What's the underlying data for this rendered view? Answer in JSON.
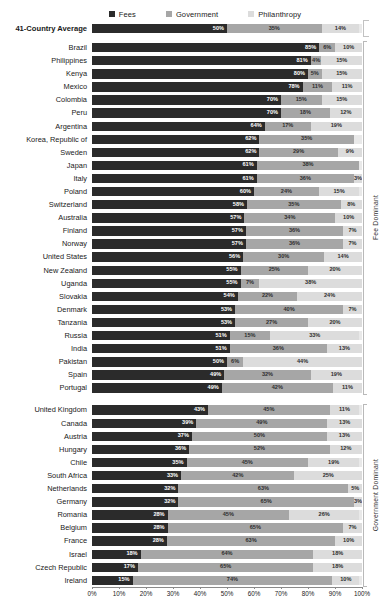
{
  "legend": {
    "items": [
      {
        "label": "Fees",
        "color": "#2b2b2b"
      },
      {
        "label": "Government",
        "color": "#a6a6a6"
      },
      {
        "label": "Philanthropy",
        "color": "#dcdcdc"
      }
    ]
  },
  "groups": {
    "fee_dominant": "Fee Dominant",
    "government_dominant": "Government Dominant"
  },
  "axis": {
    "xlabel": "Percentage of CSO Revenue",
    "ticks": [
      "0%",
      "10%",
      "20%",
      "30%",
      "40%",
      "50%",
      "60%",
      "70%",
      "80%",
      "90%",
      "100%"
    ]
  },
  "chart_data": {
    "type": "bar",
    "orientation": "horizontal",
    "stacked": true,
    "title": "",
    "xlabel": "Percentage of CSO Revenue",
    "ylabel": "",
    "xlim": [
      0,
      100
    ],
    "grid": false,
    "legend_position": "top-center",
    "series": [
      {
        "name": "Fees",
        "color": "#2b2b2b"
      },
      {
        "name": "Government",
        "color": "#a6a6a6"
      },
      {
        "name": "Philanthropy",
        "color": "#dcdcdc"
      }
    ],
    "categories": [
      "41-Country Average",
      "Brazil",
      "Philippines",
      "Kenya",
      "Mexico",
      "Colombia",
      "Peru",
      "Argentina",
      "Korea, Republic of",
      "Sweden",
      "Japan",
      "Italy",
      "Poland",
      "Switzerland",
      "Australia",
      "Finland",
      "Norway",
      "United States",
      "New Zealand",
      "Uganda",
      "Slovakia",
      "Denmark",
      "Tanzania",
      "Russia",
      "India",
      "Pakistan",
      "Spain",
      "Portugal",
      "United Kingdom",
      "Canada",
      "Austria",
      "Hungary",
      "Chile",
      "South Africa",
      "Netherlands",
      "Germany",
      "Romania",
      "Belgium",
      "France",
      "Israel",
      "Czech Republic",
      "Ireland"
    ],
    "values": {
      "Fees": [
        50,
        85,
        81,
        80,
        78,
        70,
        70,
        64,
        62,
        62,
        61,
        61,
        60,
        58,
        57,
        57,
        57,
        56,
        55,
        55,
        54,
        53,
        53,
        51,
        51,
        50,
        49,
        49,
        43,
        39,
        37,
        36,
        35,
        33,
        32,
        32,
        28,
        28,
        28,
        18,
        17,
        15
      ],
      "Government": [
        35,
        6,
        4,
        5,
        11,
        15,
        18,
        17,
        35,
        29,
        38,
        36,
        24,
        35,
        34,
        36,
        36,
        30,
        25,
        7,
        22,
        40,
        27,
        15,
        36,
        6,
        32,
        42,
        45,
        49,
        50,
        52,
        45,
        42,
        63,
        65,
        45,
        65,
        63,
        64,
        65,
        74
      ],
      "Philanthropy": [
        14,
        10,
        15,
        15,
        11,
        15,
        12,
        19,
        0,
        9,
        0,
        3,
        15,
        8,
        10,
        7,
        7,
        14,
        20,
        38,
        24,
        7,
        20,
        33,
        13,
        44,
        19,
        11,
        11,
        13,
        13,
        12,
        19,
        25,
        5,
        3,
        26,
        7,
        10,
        18,
        18,
        10
      ]
    }
  },
  "rows": [
    {
      "label": "41-Country Average",
      "fees": 50,
      "gov": 35,
      "phil": 14,
      "fees_txt": "50%",
      "gov_txt": "35%",
      "phil_txt": "14%",
      "group": "average"
    },
    {
      "label": "Brazil",
      "fees": 85,
      "gov": 6,
      "phil": 10,
      "fees_txt": "85%",
      "gov_txt": "6%",
      "phil_txt": "10%",
      "group": "fee"
    },
    {
      "label": "Philippines",
      "fees": 81,
      "gov": 4,
      "phil": 15,
      "fees_txt": "81%",
      "gov_txt": "4%",
      "phil_txt": "15%",
      "group": "fee"
    },
    {
      "label": "Kenya",
      "fees": 80,
      "gov": 5,
      "phil": 15,
      "fees_txt": "80%",
      "gov_txt": "5%",
      "phil_txt": "15%",
      "group": "fee"
    },
    {
      "label": "Mexico",
      "fees": 78,
      "gov": 11,
      "phil": 11,
      "fees_txt": "78%",
      "gov_txt": "11%",
      "phil_txt": "11%",
      "group": "fee"
    },
    {
      "label": "Colombia",
      "fees": 70,
      "gov": 15,
      "phil": 15,
      "fees_txt": "70%",
      "gov_txt": "15%",
      "phil_txt": "15%",
      "group": "fee"
    },
    {
      "label": "Peru",
      "fees": 70,
      "gov": 18,
      "phil": 12,
      "fees_txt": "70%",
      "gov_txt": "18%",
      "phil_txt": "12%",
      "group": "fee"
    },
    {
      "label": "Argentina",
      "fees": 64,
      "gov": 17,
      "phil": 19,
      "fees_txt": "64%",
      "gov_txt": "17%",
      "phil_txt": "19%",
      "group": "fee"
    },
    {
      "label": "Korea, Republic of",
      "fees": 62,
      "gov": 35,
      "phil": 0,
      "fees_txt": "62%",
      "gov_txt": "35%",
      "phil_txt": "",
      "group": "fee"
    },
    {
      "label": "Sweden",
      "fees": 62,
      "gov": 29,
      "phil": 9,
      "fees_txt": "62%",
      "gov_txt": "29%",
      "phil_txt": "9%",
      "group": "fee"
    },
    {
      "label": "Japan",
      "fees": 61,
      "gov": 38,
      "phil": 0,
      "fees_txt": "61%",
      "gov_txt": "38%",
      "phil_txt": "",
      "group": "fee"
    },
    {
      "label": "Italy",
      "fees": 61,
      "gov": 36,
      "phil": 3,
      "fees_txt": "61%",
      "gov_txt": "36%",
      "phil_txt": "3%",
      "group": "fee"
    },
    {
      "label": "Poland",
      "fees": 60,
      "gov": 24,
      "phil": 15,
      "fees_txt": "60%",
      "gov_txt": "24%",
      "phil_txt": "15%",
      "group": "fee"
    },
    {
      "label": "Switzerland",
      "fees": 58,
      "gov": 35,
      "phil": 8,
      "fees_txt": "58%",
      "gov_txt": "35%",
      "phil_txt": "8%",
      "group": "fee"
    },
    {
      "label": "Australia",
      "fees": 57,
      "gov": 34,
      "phil": 10,
      "fees_txt": "57%",
      "gov_txt": "34%",
      "phil_txt": "10%",
      "group": "fee"
    },
    {
      "label": "Finland",
      "fees": 57,
      "gov": 36,
      "phil": 7,
      "fees_txt": "57%",
      "gov_txt": "36%",
      "phil_txt": "7%",
      "group": "fee"
    },
    {
      "label": "Norway",
      "fees": 57,
      "gov": 36,
      "phil": 7,
      "fees_txt": "57%",
      "gov_txt": "36%",
      "phil_txt": "7%",
      "group": "fee"
    },
    {
      "label": "United States",
      "fees": 56,
      "gov": 30,
      "phil": 14,
      "fees_txt": "56%",
      "gov_txt": "30%",
      "phil_txt": "14%",
      "group": "fee"
    },
    {
      "label": "New Zealand",
      "fees": 55,
      "gov": 25,
      "phil": 20,
      "fees_txt": "55%",
      "gov_txt": "25%",
      "phil_txt": "20%",
      "group": "fee"
    },
    {
      "label": "Uganda",
      "fees": 55,
      "gov": 7,
      "phil": 38,
      "fees_txt": "55%",
      "gov_txt": "7%",
      "phil_txt": "38%",
      "group": "fee"
    },
    {
      "label": "Slovakia",
      "fees": 54,
      "gov": 22,
      "phil": 24,
      "fees_txt": "54%",
      "gov_txt": "22%",
      "phil_txt": "24%",
      "group": "fee"
    },
    {
      "label": "Denmark",
      "fees": 53,
      "gov": 40,
      "phil": 7,
      "fees_txt": "53%",
      "gov_txt": "40%",
      "phil_txt": "7%",
      "group": "fee"
    },
    {
      "label": "Tanzania",
      "fees": 53,
      "gov": 27,
      "phil": 20,
      "fees_txt": "53%",
      "gov_txt": "27%",
      "phil_txt": "20%",
      "group": "fee"
    },
    {
      "label": "Russia",
      "fees": 51,
      "gov": 15,
      "phil": 33,
      "fees_txt": "51%",
      "gov_txt": "15%",
      "phil_txt": "33%",
      "group": "fee"
    },
    {
      "label": "India",
      "fees": 51,
      "gov": 36,
      "phil": 13,
      "fees_txt": "51%",
      "gov_txt": "36%",
      "phil_txt": "13%",
      "group": "fee"
    },
    {
      "label": "Pakistan",
      "fees": 50,
      "gov": 6,
      "phil": 44,
      "fees_txt": "50%",
      "gov_txt": "6%",
      "phil_txt": "44%",
      "group": "fee"
    },
    {
      "label": "Spain",
      "fees": 49,
      "gov": 32,
      "phil": 19,
      "fees_txt": "49%",
      "gov_txt": "32%",
      "phil_txt": "19%",
      "group": "fee"
    },
    {
      "label": "Portugal",
      "fees": 49,
      "gov": 42,
      "phil": 11,
      "fees_txt": "49%",
      "gov_txt": "42%",
      "phil_txt": "11%",
      "group": "fee"
    },
    {
      "label": "United Kingdom",
      "fees": 43,
      "gov": 45,
      "phil": 11,
      "fees_txt": "43%",
      "gov_txt": "45%",
      "phil_txt": "11%",
      "group": "gov"
    },
    {
      "label": "Canada",
      "fees": 39,
      "gov": 49,
      "phil": 13,
      "fees_txt": "39%",
      "gov_txt": "49%",
      "phil_txt": "13%",
      "group": "gov"
    },
    {
      "label": "Austria",
      "fees": 37,
      "gov": 50,
      "phil": 13,
      "fees_txt": "37%",
      "gov_txt": "50%",
      "phil_txt": "13%",
      "group": "gov"
    },
    {
      "label": "Hungary",
      "fees": 36,
      "gov": 52,
      "phil": 12,
      "fees_txt": "36%",
      "gov_txt": "52%",
      "phil_txt": "12%",
      "group": "gov"
    },
    {
      "label": "Chile",
      "fees": 35,
      "gov": 45,
      "phil": 19,
      "fees_txt": "35%",
      "gov_txt": "45%",
      "phil_txt": "19%",
      "group": "gov"
    },
    {
      "label": "South Africa",
      "fees": 33,
      "gov": 42,
      "phil": 25,
      "fees_txt": "33%",
      "gov_txt": "42%",
      "phil_txt": "25%",
      "group": "gov"
    },
    {
      "label": "Netherlands",
      "fees": 32,
      "gov": 63,
      "phil": 5,
      "fees_txt": "32%",
      "gov_txt": "63%",
      "phil_txt": "5%",
      "group": "gov"
    },
    {
      "label": "Germany",
      "fees": 32,
      "gov": 65,
      "phil": 3,
      "fees_txt": "32%",
      "gov_txt": "65%",
      "phil_txt": "3%",
      "group": "gov"
    },
    {
      "label": "Romania",
      "fees": 28,
      "gov": 45,
      "phil": 26,
      "fees_txt": "28%",
      "gov_txt": "45%",
      "phil_txt": "26%",
      "group": "gov"
    },
    {
      "label": "Belgium",
      "fees": 28,
      "gov": 65,
      "phil": 7,
      "fees_txt": "28%",
      "gov_txt": "65%",
      "phil_txt": "7%",
      "group": "gov"
    },
    {
      "label": "France",
      "fees": 28,
      "gov": 63,
      "phil": 10,
      "fees_txt": "28%",
      "gov_txt": "63%",
      "phil_txt": "10%",
      "group": "gov"
    },
    {
      "label": "Israel",
      "fees": 18,
      "gov": 64,
      "phil": 18,
      "fees_txt": "18%",
      "gov_txt": "64%",
      "phil_txt": "18%",
      "group": "gov"
    },
    {
      "label": "Czech Republic",
      "fees": 17,
      "gov": 65,
      "phil": 18,
      "fees_txt": "17%",
      "gov_txt": "65%",
      "phil_txt": "18%",
      "group": "gov"
    },
    {
      "label": "Ireland",
      "fees": 15,
      "gov": 74,
      "phil": 10,
      "fees_txt": "15%",
      "gov_txt": "74%",
      "phil_txt": "10%",
      "group": "gov"
    }
  ]
}
